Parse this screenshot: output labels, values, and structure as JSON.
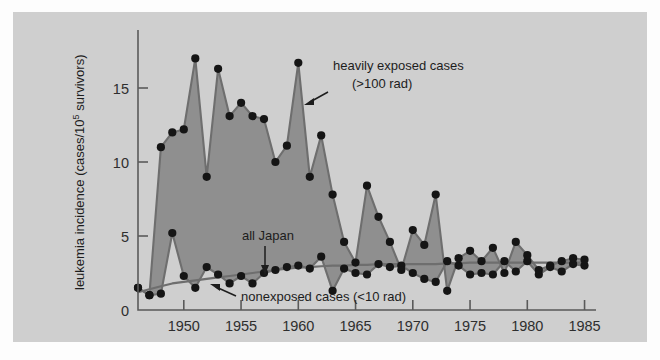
{
  "figure": {
    "background_color": "#cfcfcf",
    "page_color": "#fdfdfd",
    "fill_color": "#8f8f8f",
    "line_color": "#6e6e6e",
    "dot_color": "#151515",
    "axis_color": "#5a5a5a"
  },
  "chart_data": {
    "type": "line",
    "title": "",
    "subtitle": "",
    "xlabel": "",
    "ylabel": "leukemia incidence (cases/10⁵ survivors)",
    "ylabel_parts": {
      "before": "leukemia incidence (cases/10",
      "exponent": "5",
      "after": " survivors)"
    },
    "xlim": [
      1946,
      1986
    ],
    "ylim": [
      0,
      18
    ],
    "yticks": [
      0,
      5,
      10,
      15
    ],
    "ytick_labels": [
      "0",
      "5",
      "10",
      "15"
    ],
    "xticks": [
      1950,
      1955,
      1960,
      1965,
      1970,
      1975,
      1980,
      1985
    ],
    "xtick_labels": [
      "1950",
      "1955",
      "1960",
      "1965",
      "1970",
      "1975",
      "1980",
      "1985"
    ],
    "grid": false,
    "legend_position": "inline-annotations",
    "x": [
      1946,
      1947,
      1948,
      1949,
      1950,
      1951,
      1952,
      1953,
      1954,
      1955,
      1956,
      1957,
      1958,
      1959,
      1960,
      1961,
      1962,
      1963,
      1964,
      1965,
      1966,
      1967,
      1968,
      1969,
      1970,
      1971,
      1972,
      1973,
      1974,
      1975,
      1976,
      1977,
      1978,
      1979,
      1980,
      1981,
      1982,
      1983,
      1984,
      1985
    ],
    "series": [
      {
        "name": "heavily exposed cases (>100 rad)",
        "short_name": "heavily-exposed",
        "dose_note": "(>100 rad)",
        "values": [
          1.5,
          1.0,
          11.0,
          12.0,
          12.2,
          17.0,
          9.0,
          16.3,
          13.1,
          14.0,
          13.1,
          12.9,
          10.0,
          11.1,
          16.7,
          9.0,
          11.8,
          7.8,
          4.6,
          3.2,
          8.4,
          6.3,
          4.6,
          2.7,
          5.4,
          4.4,
          7.8,
          1.3,
          3.5,
          4.0,
          3.3,
          4.2,
          2.5,
          4.6,
          3.7,
          2.7,
          3.0,
          3.3,
          3.5,
          3.4
        ]
      },
      {
        "name": "nonexposed cases (<10 rad)",
        "short_name": "nonexposed",
        "dose_note": "(<10 rad)",
        "values": [
          1.5,
          1.0,
          1.1,
          5.2,
          2.3,
          1.5,
          2.9,
          2.4,
          1.8,
          2.3,
          1.8,
          2.5,
          2.7,
          2.9,
          3.0,
          2.8,
          3.6,
          1.3,
          2.8,
          2.5,
          2.4,
          3.1,
          2.9,
          3.0,
          2.5,
          2.1,
          1.9,
          3.3,
          3.0,
          2.4,
          2.5,
          2.4,
          3.3,
          2.6,
          3.3,
          2.4,
          2.9,
          2.6,
          3.1,
          3.0
        ]
      },
      {
        "name": "all Japan",
        "short_name": "all-japan",
        "values": [
          1.2,
          1.4,
          1.6,
          1.8,
          1.9,
          2.0,
          2.1,
          2.2,
          2.3,
          2.4,
          2.5,
          2.6,
          2.7,
          2.8,
          2.85,
          2.9,
          2.95,
          3.0,
          3.0,
          3.05,
          3.05,
          3.1,
          3.1,
          3.1,
          3.1,
          3.1,
          3.1,
          3.15,
          3.15,
          3.2,
          3.2,
          3.2,
          3.2,
          3.2,
          3.2,
          3.2,
          3.2,
          3.2,
          3.2,
          3.2
        ]
      }
    ],
    "annotations": [
      {
        "id": "heavily-exposed-annotation",
        "line1": "heavily exposed cases",
        "line2": "(>100 rad)",
        "arrow": "left-down"
      },
      {
        "id": "all-japan-annotation",
        "line1": "all Japan",
        "arrow": "down"
      },
      {
        "id": "nonexposed-annotation",
        "line1": "nonexposed cases (<10 rad)",
        "arrow": "left-up"
      }
    ]
  }
}
